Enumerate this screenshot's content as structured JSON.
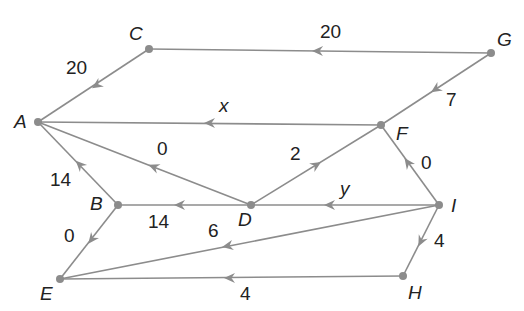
{
  "diagram": {
    "type": "directed-weighted-network",
    "colors": {
      "edge": "#8c8c8c",
      "node": "#8c8c8c",
      "text": "#222222",
      "background": "#ffffff"
    },
    "nodes": [
      {
        "id": "A",
        "label": "A",
        "x": 38,
        "y": 122,
        "lx": 14,
        "ly": 128
      },
      {
        "id": "B",
        "label": "B",
        "x": 118,
        "y": 205,
        "lx": 90,
        "ly": 210
      },
      {
        "id": "C",
        "label": "C",
        "x": 149,
        "y": 49,
        "lx": 129,
        "ly": 40
      },
      {
        "id": "D",
        "label": "D",
        "x": 251,
        "y": 205,
        "lx": 238,
        "ly": 226
      },
      {
        "id": "E",
        "label": "E",
        "x": 60,
        "y": 279,
        "lx": 40,
        "ly": 300
      },
      {
        "id": "F",
        "label": "F",
        "x": 381,
        "y": 125,
        "lx": 396,
        "ly": 140
      },
      {
        "id": "G",
        "label": "G",
        "x": 491,
        "y": 53,
        "lx": 497,
        "ly": 46
      },
      {
        "id": "H",
        "label": "H",
        "x": 403,
        "y": 276,
        "lx": 408,
        "ly": 299
      },
      {
        "id": "I",
        "label": "I",
        "x": 439,
        "y": 205,
        "lx": 451,
        "ly": 212
      }
    ],
    "edges": [
      {
        "from": "G",
        "to": "C",
        "weight": "20",
        "italic": false,
        "ax": 318,
        "ay": 51,
        "wx": 320,
        "wy": 38
      },
      {
        "from": "C",
        "to": "A",
        "weight": "20",
        "italic": false,
        "ax": 97,
        "ay": 85,
        "wx": 66,
        "wy": 74
      },
      {
        "from": "G",
        "to": "F",
        "weight": "7",
        "italic": false,
        "ax": 436,
        "ay": 89,
        "wx": 446,
        "wy": 106
      },
      {
        "from": "F",
        "to": "A",
        "weight": "x",
        "italic": true,
        "ax": 210,
        "ay": 123,
        "wx": 219,
        "wy": 112
      },
      {
        "from": "D",
        "to": "A",
        "weight": "0",
        "italic": false,
        "ax": 154,
        "ay": 167,
        "wx": 157,
        "wy": 155
      },
      {
        "from": "D",
        "to": "F",
        "weight": "2",
        "italic": false,
        "ax": 316,
        "ay": 165,
        "wx": 290,
        "wy": 160
      },
      {
        "from": "I",
        "to": "F",
        "weight": "0",
        "italic": false,
        "ax": 408,
        "ay": 163,
        "wx": 421,
        "wy": 169
      },
      {
        "from": "B",
        "to": "A",
        "weight": "14",
        "italic": false,
        "ax": 80,
        "ay": 165,
        "wx": 50,
        "wy": 186
      },
      {
        "from": "D",
        "to": "B",
        "weight": "14",
        "italic": false,
        "ax": 180,
        "ay": 205,
        "wx": 148,
        "wy": 228
      },
      {
        "from": "I",
        "to": "D",
        "weight": "y",
        "italic": true,
        "ax": 330,
        "ay": 205,
        "wx": 340,
        "wy": 195
      },
      {
        "from": "B",
        "to": "E",
        "weight": "0",
        "italic": false,
        "ax": 92,
        "ay": 239,
        "wx": 64,
        "wy": 242
      },
      {
        "from": "I",
        "to": "E",
        "weight": "6",
        "italic": false,
        "ax": 228,
        "ay": 246,
        "wx": 208,
        "wy": 237
      },
      {
        "from": "I",
        "to": "H",
        "weight": "4",
        "italic": false,
        "ax": 421,
        "ay": 241,
        "wx": 434,
        "wy": 247
      },
      {
        "from": "H",
        "to": "E",
        "weight": "4",
        "italic": false,
        "ax": 230,
        "ay": 278,
        "wx": 240,
        "wy": 300
      }
    ]
  }
}
